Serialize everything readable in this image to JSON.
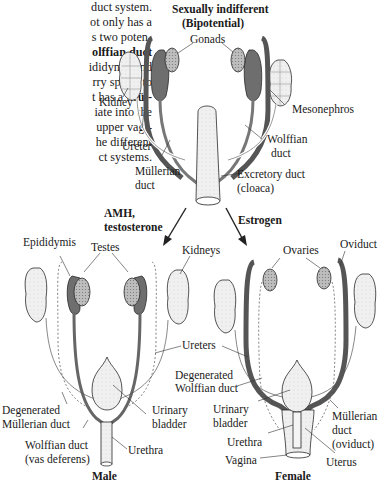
{
  "paragraph": {
    "lines": [
      {
        "text": "duct system.",
        "bold": ""
      },
      {
        "text": "ot only has a",
        "bold": ""
      },
      {
        "text": "s two poten-",
        "bold": ""
      },
      {
        "text": "",
        "bold": "olffian duct"
      },
      {
        "text": "ididymis and",
        "bold": ""
      },
      {
        "text": "rry sperm to",
        "bold": ""
      },
      {
        "text": "t has a ",
        "bold": "Mül-"
      },
      {
        "text": "iate into the",
        "bold": ""
      },
      {
        "text": "upper vagi-",
        "bold": ""
      },
      {
        "text": "he different",
        "bold": ""
      },
      {
        "text": "ct systems.",
        "bold": ""
      }
    ]
  },
  "figure": {
    "indifferent": {
      "title_line1": "Sexually indifferent",
      "title_line2": "(Bipotential)",
      "labels": {
        "gonads": "Gonads",
        "kidney": "Kidney",
        "mesonephros": "Mesonephros",
        "ureter": "Ureter",
        "wolffian_1": "Wolffian",
        "wolffian_2": "duct",
        "mullerian_1": "Müllerian",
        "mullerian_2": "duct",
        "excretory_1": "Excretory duct",
        "excretory_2": "(cloaca)"
      }
    },
    "pathways": {
      "male_1": "AMH,",
      "male_2": "testosterone",
      "female": "Estrogen"
    },
    "male": {
      "title": "Male",
      "labels": {
        "epididymis": "Epididymis",
        "testes": "Testes",
        "degenerated_mullerian_1": "Degenerated",
        "degenerated_mullerian_2": "Müllerian duct",
        "urinary_bladder_1": "Urinary",
        "urinary_bladder_2": "bladder",
        "wolffian_1": "Wolffian duct",
        "wolffian_2": "(vas deferens)",
        "urethra": "Urethra"
      }
    },
    "shared": {
      "kidneys": "Kidneys",
      "ureters": "Ureters",
      "degenerated_wolffian_1": "Degenerated",
      "degenerated_wolffian_2": "Wolffian duct"
    },
    "female": {
      "title": "Female",
      "labels": {
        "ovaries": "Ovaries",
        "oviduct": "Oviduct",
        "urinary_bladder_1": "Urinary",
        "urinary_bladder_2": "bladder",
        "urethra": "Urethra",
        "vagina": "Vagina",
        "mullerian_1": "Müllerian",
        "mullerian_2": "duct",
        "mullerian_3": "(oviduct)",
        "uterus": "Uterus"
      }
    }
  },
  "colors": {
    "duct_dark": "#6e6e6e",
    "tissue_light": "#e8e8e8",
    "kidney_fill": "#dcdcdc",
    "line": "#2a2a2a"
  }
}
